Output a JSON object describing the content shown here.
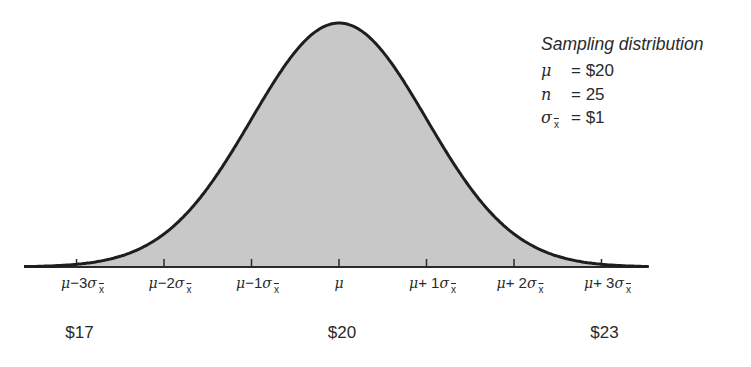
{
  "chart_data": {
    "type": "area",
    "title": "Sampling distribution",
    "xlabel": "",
    "ylabel": "",
    "distribution": "normal",
    "parameters": {
      "mu": 20,
      "n": 25,
      "sigma_xbar": 1
    },
    "x_ticks": [
      {
        "sigma": -3,
        "label": "μ−3σ",
        "subscript": "x",
        "dollar": "$17"
      },
      {
        "sigma": -2,
        "label": "μ−2σ",
        "subscript": "x",
        "dollar": ""
      },
      {
        "sigma": -1,
        "label": "μ−1σ",
        "subscript": "x",
        "dollar": ""
      },
      {
        "sigma": 0,
        "label": "μ",
        "subscript": "",
        "dollar": "$20"
      },
      {
        "sigma": 1,
        "label": "μ+ 1σ",
        "subscript": "x",
        "dollar": ""
      },
      {
        "sigma": 2,
        "label": "μ+ 2σ",
        "subscript": "x",
        "dollar": ""
      },
      {
        "sigma": 3,
        "label": "μ+ 3σ",
        "subscript": "x",
        "dollar": "$23"
      }
    ],
    "xlim_sigma": [
      -3.6,
      3.55
    ],
    "fill_color": "#c8c8c8",
    "line_color": "#1e1e1e",
    "grid": false,
    "legend_position": "upper right"
  },
  "legend": {
    "title": "Sampling distribution",
    "rows": [
      {
        "symbol": "μ",
        "sub": "",
        "value": "= $20"
      },
      {
        "symbol": "n",
        "sub": "",
        "value": "= 25"
      },
      {
        "symbol": "σ",
        "sub": "x",
        "value": "= $1"
      }
    ]
  },
  "dollar_labels": [
    {
      "sigma": -3,
      "text": "$17"
    },
    {
      "sigma": 0,
      "text": "$20"
    },
    {
      "sigma": 3,
      "text": "$23"
    }
  ]
}
